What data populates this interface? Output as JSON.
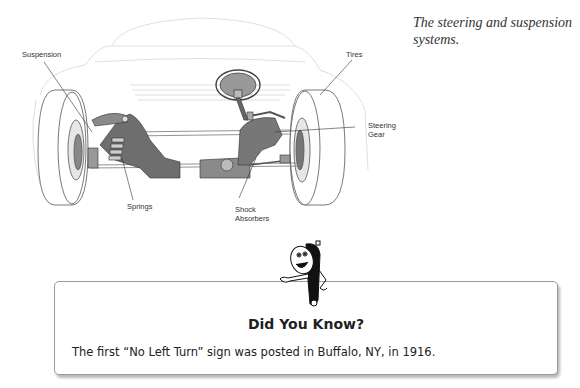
{
  "figure": {
    "name": "steering-and-suspension-diagram",
    "labels": {
      "suspension": "Suspension",
      "tires": "Tires",
      "steering_gear": "Steering\nGear",
      "springs": "Springs",
      "shock_absorbers": "Shock\nAbsorbers"
    },
    "caption": "The steering and suspension systems."
  },
  "did_you_know": {
    "title": "Did You Know?",
    "text": "The first “No Left Turn” sign was posted in Buffalo, NY, in 1916.",
    "mascot_icon": "tire-gauge-mascot-icon"
  }
}
